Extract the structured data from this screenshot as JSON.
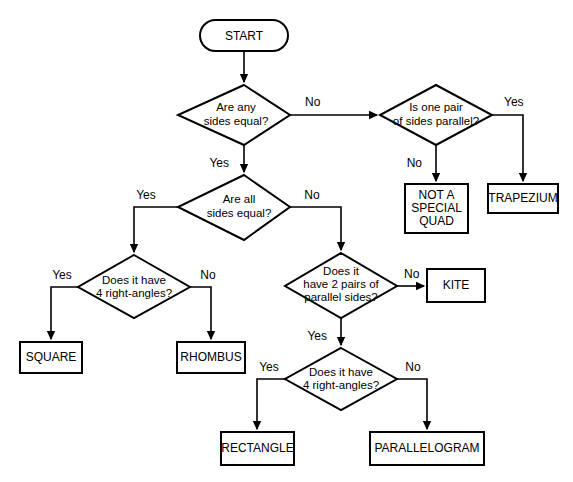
{
  "diagram": {
    "background_color": "#ffffff",
    "line_color": "#000000",
    "shape_fill": "#ffffff"
  },
  "nodes": {
    "start": {
      "label": "START",
      "type": "terminal"
    },
    "d_any_sides_equal": {
      "line1": "Are any",
      "line2": "sides equal?",
      "type": "decision"
    },
    "d_one_pair_parallel": {
      "line1": "Is one pair",
      "line2": "of sides parallel?",
      "type": "decision"
    },
    "d_all_sides_equal": {
      "line1": "Are all",
      "line2": "sides equal?",
      "type": "decision"
    },
    "d_four_right_angles_left": {
      "line1": "Does it have",
      "line2": "4 right-angles?",
      "type": "decision"
    },
    "d_two_pairs_parallel": {
      "line1": "Does it",
      "line2": "have 2 pairs of",
      "line3": "parallel sides?",
      "type": "decision"
    },
    "d_four_right_angles_bottom": {
      "line1": "Does it have",
      "line2": "4 right-angles?",
      "type": "decision"
    },
    "r_not_special_quad": {
      "line1": "NOT A",
      "line2": "SPECIAL",
      "line3": "QUAD",
      "type": "result"
    },
    "r_trapezium": {
      "label": "TRAPEZIUM",
      "type": "result"
    },
    "r_square": {
      "label": "SQUARE",
      "type": "result"
    },
    "r_rhombus": {
      "label": "RHOMBUS",
      "type": "result"
    },
    "r_kite": {
      "label": "KITE",
      "type": "result"
    },
    "r_rectangle": {
      "label": "RECTANGLE",
      "type": "result"
    },
    "r_parallelogram": {
      "label": "PARALLELOGRAM",
      "type": "result"
    }
  },
  "edges": [
    {
      "id": "start-to-any",
      "from": "start",
      "to": "d_any_sides_equal",
      "label": ""
    },
    {
      "id": "any-no",
      "from": "d_any_sides_equal",
      "to": "d_one_pair_parallel",
      "label": "No"
    },
    {
      "id": "any-yes",
      "from": "d_any_sides_equal",
      "to": "d_all_sides_equal",
      "label": "Yes"
    },
    {
      "id": "onepair-yes",
      "from": "d_one_pair_parallel",
      "to": "r_trapezium",
      "label": "Yes"
    },
    {
      "id": "onepair-no",
      "from": "d_one_pair_parallel",
      "to": "r_not_special_quad",
      "label": "No"
    },
    {
      "id": "all-yes",
      "from": "d_all_sides_equal",
      "to": "d_four_right_angles_left",
      "label": "Yes"
    },
    {
      "id": "all-no",
      "from": "d_all_sides_equal",
      "to": "d_two_pairs_parallel",
      "label": "No"
    },
    {
      "id": "fourleft-yes",
      "from": "d_four_right_angles_left",
      "to": "r_square",
      "label": "Yes"
    },
    {
      "id": "fourleft-no",
      "from": "d_four_right_angles_left",
      "to": "r_rhombus",
      "label": "No"
    },
    {
      "id": "twopairs-no",
      "from": "d_two_pairs_parallel",
      "to": "r_kite",
      "label": "No"
    },
    {
      "id": "twopairs-yes",
      "from": "d_two_pairs_parallel",
      "to": "d_four_right_angles_bottom",
      "label": "Yes"
    },
    {
      "id": "fourbottom-yes",
      "from": "d_four_right_angles_bottom",
      "to": "r_rectangle",
      "label": "Yes"
    },
    {
      "id": "fourbottom-no",
      "from": "d_four_right_angles_bottom",
      "to": "r_parallelogram",
      "label": "No"
    }
  ],
  "edge_labels": {
    "any_no": "No",
    "any_yes": "Yes",
    "onepair_yes": "Yes",
    "onepair_no": "No",
    "all_yes": "Yes",
    "all_no": "No",
    "fourleft_yes": "Yes",
    "fourleft_no": "No",
    "twopairs_no": "No",
    "twopairs_yes": "Yes",
    "fourbottom_yes": "Yes",
    "fourbottom_no": "No"
  }
}
